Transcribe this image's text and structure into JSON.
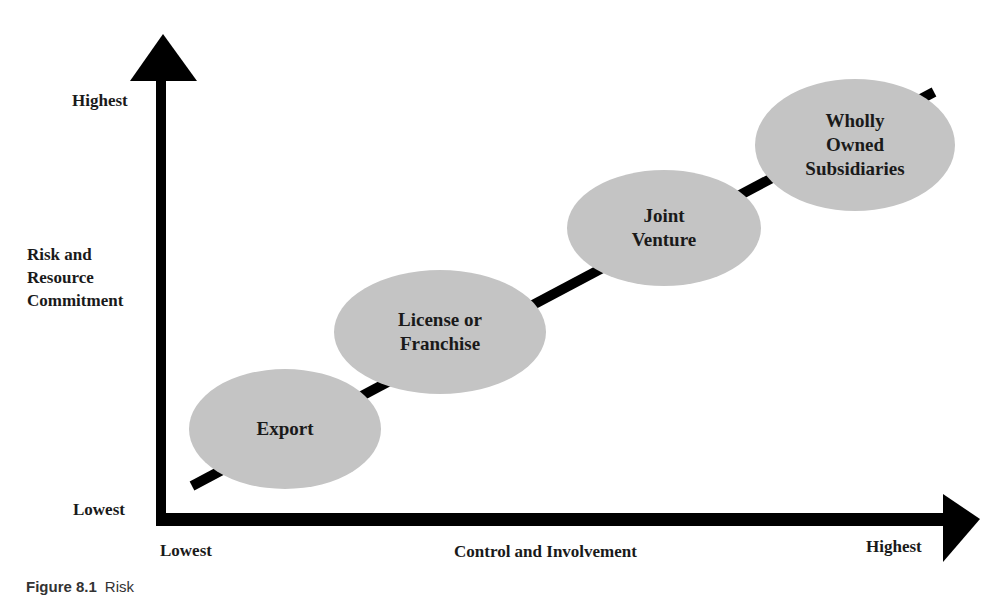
{
  "diagram": {
    "type": "risk-control-continuum",
    "y_axis": {
      "title": "Risk and\nResource\nCommitment",
      "high_label": "Highest",
      "low_label": "Lowest"
    },
    "x_axis": {
      "title": "Control and Involvement",
      "low_label": "Lowest",
      "high_label": "Highest"
    },
    "nodes": [
      {
        "label": "Export"
      },
      {
        "label": "License or\nFranchise"
      },
      {
        "label": "Joint\nVenture"
      },
      {
        "label": "Wholly\nOwned\nSubsidiaries"
      }
    ],
    "colors": {
      "node_fill": "#c4c4c4",
      "axis": "#000000",
      "text": "#1a1a1a"
    }
  },
  "caption": {
    "figure_number": "Figure 8.1",
    "text": "Risk"
  }
}
